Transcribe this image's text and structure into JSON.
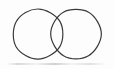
{
  "figure": {
    "background_color": "#fdfdfd",
    "stroke_color": "#3a3a3a",
    "stroke_width": 1.2,
    "canvas": {
      "width": 114,
      "height": 69
    }
  },
  "chart_data": {
    "type": "diagram",
    "subtype": "venn-2set",
    "shapes": [
      {
        "name": "left-circle",
        "kind": "circle",
        "cx": 38,
        "cy": 34,
        "r": 25,
        "fill": "none",
        "stroke": "#3a3a3a"
      },
      {
        "name": "right-circle",
        "kind": "circle",
        "cx": 76,
        "cy": 34,
        "r": 25,
        "fill": "none",
        "stroke": "#3a3a3a"
      }
    ],
    "intersection": {
      "name": "lens",
      "top_point": [
        58,
        13
      ],
      "bottom_point": [
        58,
        56
      ],
      "left_extent_x": 52,
      "right_extent_x": 65
    },
    "extents": {
      "left_x": 13,
      "right_x": 101,
      "top_y": 9,
      "bottom_y": 60
    },
    "labels": [],
    "legend": [],
    "grid": false
  }
}
